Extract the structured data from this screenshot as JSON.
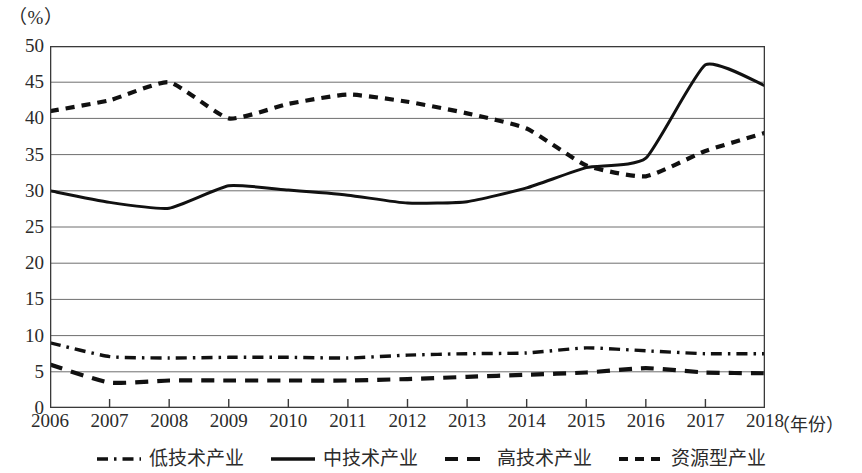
{
  "chart_data": {
    "type": "line",
    "title": "",
    "xlabel": "（年份）",
    "ylabel": "（%）",
    "unit_label": "（%）",
    "x": [
      2006,
      2007,
      2008,
      2009,
      2010,
      2011,
      2012,
      2013,
      2014,
      2015,
      2016,
      2017,
      2018
    ],
    "categories": [
      "2006",
      "2007",
      "2008",
      "2009",
      "2010",
      "2011",
      "2012",
      "2013",
      "2014",
      "2015",
      "2016",
      "2017",
      "2018"
    ],
    "xlim": [
      2006,
      2018
    ],
    "ylim": [
      0,
      50
    ],
    "y_ticks": [
      0,
      5,
      10,
      15,
      20,
      25,
      30,
      35,
      40,
      45,
      50
    ],
    "y_tick_labels": [
      "0",
      "5",
      "10",
      "15",
      "20",
      "25",
      "30",
      "35",
      "40",
      "45",
      "50"
    ],
    "grid": "horizontal",
    "legend_position": "bottom",
    "series": [
      {
        "name": "低技术产业",
        "style": "dash-dot",
        "color": "#111111",
        "values": [
          9.0,
          7.1,
          6.9,
          7.0,
          7.0,
          6.9,
          7.3,
          7.5,
          7.6,
          8.3,
          7.9,
          7.5,
          7.5
        ]
      },
      {
        "name": "中技术产业",
        "style": "solid",
        "color": "#111111",
        "values": [
          30.0,
          28.4,
          27.6,
          30.7,
          30.1,
          29.4,
          28.3,
          28.5,
          30.4,
          33.2,
          34.5,
          47.4,
          44.5
        ]
      },
      {
        "name": "高技术产业",
        "style": "dashed",
        "color": "#111111",
        "values": [
          6.0,
          3.5,
          3.8,
          3.8,
          3.8,
          3.8,
          4.0,
          4.3,
          4.6,
          4.9,
          5.5,
          4.9,
          4.8
        ]
      },
      {
        "name": "资源型产业",
        "style": "dotted",
        "color": "#111111",
        "values": [
          41.0,
          42.5,
          45.0,
          40.0,
          42.0,
          43.3,
          42.3,
          40.7,
          38.6,
          33.5,
          32.0,
          35.5,
          38.0
        ]
      }
    ]
  },
  "legend": {
    "items": [
      {
        "label": "低技术产业",
        "mark": "dash-dot-line-icon"
      },
      {
        "label": "中技术产业",
        "mark": "solid-line-icon"
      },
      {
        "label": "高技术产业",
        "mark": "dashed-line-icon"
      },
      {
        "label": "资源型产业",
        "mark": "dotted-line-icon"
      }
    ]
  }
}
